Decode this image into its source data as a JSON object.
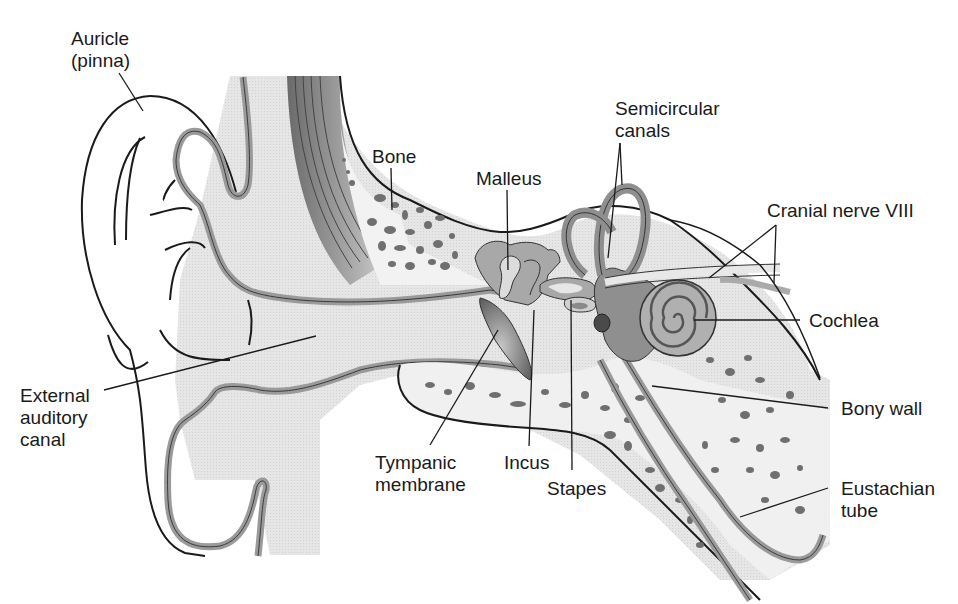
{
  "diagram": {
    "colors": {
      "background": "#ffffff",
      "skin_fill": "#ececec",
      "tissue_fill": "#dcdcdc",
      "cartilage_band": "#9a9a9a",
      "bone_fill": "#f0f0f0",
      "bone_pores": "#6f6f6f",
      "ossicle_fill": "#a8a8a8",
      "inner_ear_fill": "#8f8f8f",
      "outline": "#1a1a1a",
      "text": "#1a1a1a"
    },
    "labels": {
      "auricle": {
        "line1": "Auricle",
        "line2": "(pinna)"
      },
      "bone": {
        "line1": "Bone"
      },
      "malleus": {
        "line1": "Malleus"
      },
      "semicircular": {
        "line1": "Semicircular",
        "line2": "canals"
      },
      "cranial_nerve": {
        "line1": "Cranial nerve VIII"
      },
      "cochlea": {
        "line1": "Cochlea"
      },
      "external_canal": {
        "line1": "External",
        "line2": "auditory",
        "line3": "canal"
      },
      "bony_wall": {
        "line1": "Bony wall"
      },
      "tympanic": {
        "line1": "Tympanic",
        "line2": "membrane"
      },
      "incus": {
        "line1": "Incus"
      },
      "stapes": {
        "line1": "Stapes"
      },
      "eustachian": {
        "line1": "Eustachian",
        "line2": "tube"
      }
    }
  }
}
